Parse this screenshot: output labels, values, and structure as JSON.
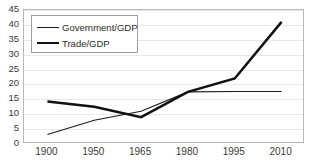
{
  "chart_data": {
    "type": "line",
    "title": "",
    "xlabel": "",
    "ylabel": "",
    "categories": [
      "1900",
      "1950",
      "1965",
      "1980",
      "1995",
      "2010"
    ],
    "series": [
      {
        "name": "Government/GDP",
        "style": "thin",
        "color": "#1a1a1a",
        "values": [
          3.2,
          8.0,
          11.0,
          17.5,
          17.6,
          17.6
        ]
      },
      {
        "name": "Trade/GDP",
        "style": "thick",
        "color": "#111111",
        "values": [
          14.3,
          12.5,
          9.0,
          17.5,
          22.0,
          41.0
        ]
      }
    ],
    "ylim": [
      0,
      45
    ],
    "ytick_step": 5,
    "yticks": [
      "0",
      "5",
      "10",
      "15",
      "20",
      "25",
      "30",
      "35",
      "40",
      "45"
    ],
    "grid": true,
    "grid_color": "#e9e9e9",
    "legend_position": "top-left",
    "plot_border_color": "#b9b9b9"
  },
  "legend": {
    "entries": [
      {
        "label": "Government/GDP"
      },
      {
        "label": "Trade/GDP"
      }
    ]
  }
}
